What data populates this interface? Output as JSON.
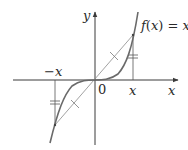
{
  "figure": {
    "function_label": "f(x) = x³",
    "function_label_parts": {
      "f": "f",
      "open": "(",
      "var": "x",
      "close": ")",
      "eq": " = ",
      "base": "x",
      "exp": "3"
    },
    "axis_labels": {
      "x": "x",
      "y": "y"
    },
    "tick_labels": {
      "origin": "0",
      "pos_x": "x",
      "neg_x": "−x"
    },
    "colors": {
      "curve": "#6a6a6a",
      "axes": "#3a3a3a",
      "chord": "#8a8a8a",
      "text": "#2a2a2a"
    }
  }
}
